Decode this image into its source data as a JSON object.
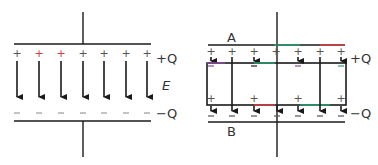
{
  "diagram": {
    "left_panel": {
      "charge_top_label": "+Q",
      "charge_bottom_label": "−Q",
      "field_label": "E",
      "plus_sign": "+",
      "minus_sign": "−",
      "field_line_count": 7,
      "plus_colors": [
        "#888888",
        "#d04040",
        "#d04040",
        "#888888",
        "#888888",
        "#888888",
        "#888888"
      ]
    },
    "right_panel": {
      "plate_top_label": "A",
      "plate_bottom_label": "B",
      "charge_top_label": "+Q",
      "charge_bottom_label": "−Q",
      "plus_sign": "+",
      "minus_sign": "−",
      "field_line_count": 7,
      "slab": "conductor slab between plates"
    },
    "colors": {
      "line": "#1a1a1a",
      "text": "#333333",
      "accent_red": "#d04040",
      "accent_green": "#2a9a6a",
      "accent_purple": "#8a4a9a"
    }
  }
}
